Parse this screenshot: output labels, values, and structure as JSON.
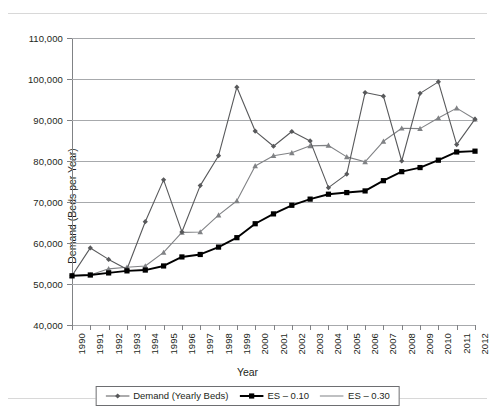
{
  "figure": {
    "axis_title_y": "Demand (Beds per Year)",
    "axis_title_x": "Year"
  },
  "legend": {
    "items": [
      {
        "label": "Demand (Yearly Beds)",
        "key": "line-diamond-marker",
        "color": "#58595b"
      },
      {
        "label": "ES – 0.10",
        "key": "line-square-marker",
        "color": "#000000"
      },
      {
        "label": "ES – 0.30",
        "key": "line-plain",
        "color": "#808285"
      }
    ]
  },
  "chart_data": {
    "type": "line",
    "title": "",
    "xlabel": "Year",
    "ylabel": "Demand (Beds per Year)",
    "x": [
      1990,
      1991,
      1992,
      1993,
      1994,
      1995,
      1996,
      1997,
      1998,
      1999,
      2000,
      2001,
      2002,
      2003,
      2004,
      2005,
      2006,
      2007,
      2008,
      2009,
      2010,
      2011,
      2012
    ],
    "xlim": [
      1990,
      2012
    ],
    "ylim": [
      40000,
      110000
    ],
    "yticks": [
      40000,
      50000,
      60000,
      70000,
      80000,
      90000,
      100000,
      110000
    ],
    "ytick_labels": [
      "40,000",
      "50,000",
      "60,000",
      "70,000",
      "80,000",
      "90,000",
      "100,000",
      "110,000"
    ],
    "xtick_labels": [
      "1990",
      "1991",
      "1992",
      "1993",
      "1994",
      "1995",
      "1996",
      "1997",
      "1998",
      "1999",
      "2000",
      "2001",
      "2002",
      "2003",
      "2004",
      "2005",
      "2006",
      "2007",
      "2008",
      "2009",
      "2010",
      "2011",
      "2012"
    ],
    "grid": "horizontal",
    "legend_position": "bottom-center",
    "series": [
      {
        "name": "Demand (Yearly Beds)",
        "color": "#58595b",
        "marker": "diamond",
        "values": [
          52000,
          58800,
          56000,
          53600,
          65200,
          75400,
          62700,
          74000,
          81300,
          98000,
          87300,
          83600,
          87200,
          84900,
          73500,
          76800,
          96700,
          95800,
          80000,
          96500,
          99300,
          84000,
          90200
        ]
      },
      {
        "name": "ES – 0.10",
        "color": "#000000",
        "marker": "square",
        "values": [
          52000,
          52200,
          52700,
          53200,
          53400,
          54400,
          56600,
          57200,
          59000,
          61300,
          64700,
          67100,
          69200,
          70700,
          71900,
          72300,
          72700,
          75200,
          77400,
          78400,
          80200,
          82200,
          82400
        ]
      },
      {
        "name": "ES – 0.30",
        "color": "#808285",
        "marker": "triangle",
        "values": [
          52000,
          52200,
          53700,
          54100,
          54400,
          57700,
          62600,
          62700,
          66800,
          70300,
          78800,
          81300,
          82000,
          83700,
          83800,
          81000,
          79800,
          84800,
          88000,
          87900,
          90500,
          92900,
          90200
        ]
      }
    ]
  }
}
